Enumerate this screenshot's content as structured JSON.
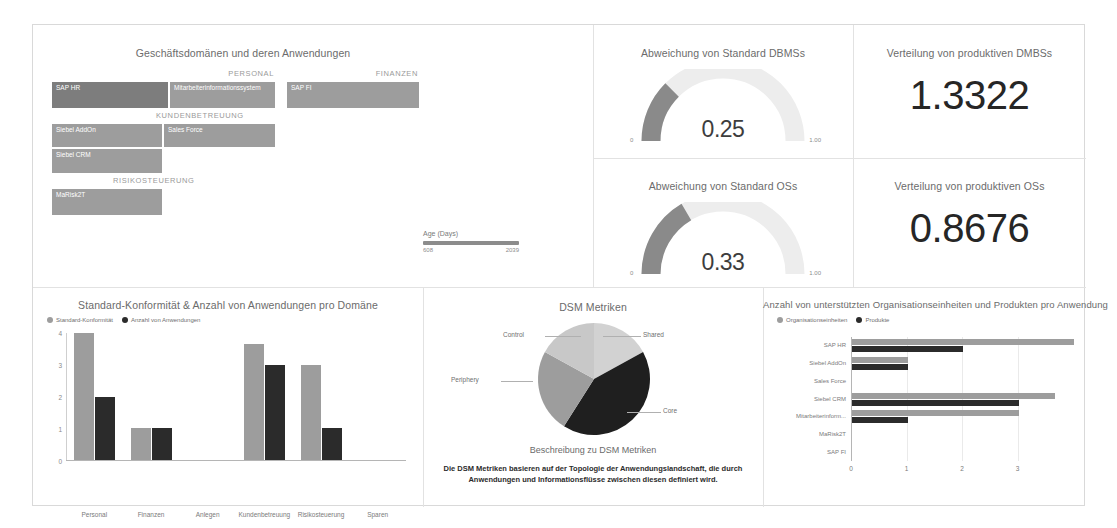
{
  "colors": {
    "series_a": "#9d9d9d",
    "series_b": "#2b2b2b",
    "gauge_fill": "#8a8a8a",
    "gauge_track": "#ededed",
    "panel_border": "#d9d9d9"
  },
  "treemap": {
    "title": "Geschäftsdomänen und deren Anwendungen",
    "groups": [
      {
        "label": "PERSONAL",
        "cells": [
          {
            "label": "SAP HR"
          },
          {
            "label": "Mitarbeiterinformationssystem"
          }
        ]
      },
      {
        "label": "FINANZEN",
        "cells": [
          {
            "label": "SAP FI"
          }
        ]
      },
      {
        "label": "KUNDENBETREUUNG",
        "cells": [
          {
            "label": "Siebel AddOn"
          },
          {
            "label": "Sales Force"
          },
          {
            "label": "Siebel CRM"
          }
        ]
      },
      {
        "label": "RISIKOSTEUERUNG",
        "cells": [
          {
            "label": "MaRisk2T"
          }
        ]
      }
    ]
  },
  "slider": {
    "label": "Age (Days)",
    "min": "608",
    "max": "2039"
  },
  "gauges": [
    {
      "title": "Abweichung von Standard DBMSs",
      "value": "0.25",
      "min": "0",
      "max": "1.00",
      "fraction": 0.25
    },
    {
      "title": "Abweichung von Standard OSs",
      "value": "0.33",
      "min": "0",
      "max": "1.00",
      "fraction": 0.33
    }
  ],
  "kpis": [
    {
      "title": "Verteilung von produktiven DMBSs",
      "value": "1.3322"
    },
    {
      "title": "Verteilung von produktiven OSs",
      "value": "0.8676"
    }
  ],
  "bar_chart": {
    "title": "Standard-Konformität & Anzahl von Anwendungen pro Domäne",
    "legend": [
      {
        "label": "Standard-Konformität",
        "color": "#9d9d9d"
      },
      {
        "label": "Anzahl von Anwendungen",
        "color": "#2b2b2b"
      }
    ],
    "yticks": [
      "0",
      "1",
      "2",
      "3",
      "4"
    ]
  },
  "pie_chart": {
    "title": "DSM Metriken",
    "labels": {
      "shared": "Shared",
      "core": "Core",
      "periphery": "Periphery",
      "control": "Control"
    },
    "description_title": "Beschreibung zu DSM Metriken",
    "description_line1": "Die DSM Metriken basieren auf der Topologie der Anwendungslandschaft, die durch",
    "description_line2": "Anwendungen und Informationsflüsse zwischen diesen definiert wird."
  },
  "hbar_chart": {
    "title": "Anzahl von unterstützten Organisationseinheiten und Produkten pro Anwendung",
    "legend": [
      {
        "label": "Organisationseinheiten",
        "color": "#9d9d9d"
      },
      {
        "label": "Produkte",
        "color": "#2b2b2b"
      }
    ],
    "xticks": [
      "0",
      "1",
      "2",
      "3"
    ]
  },
  "chart_data": [
    {
      "type": "bar",
      "title": "Standard-Konformität & Anzahl von Anwendungen pro Domäne",
      "categories": [
        "Personal",
        "Finanzen",
        "Anlegen",
        "Kundenbetreuung",
        "Risikosteuerung",
        "Sparen"
      ],
      "series": [
        {
          "name": "Standard-Konformität",
          "color": "#9d9d9d",
          "values": [
            4,
            1,
            0,
            3.65,
            3,
            0
          ]
        },
        {
          "name": "Anzahl von Anwendungen",
          "color": "#2b2b2b",
          "values": [
            2,
            1,
            0,
            3,
            1,
            0
          ]
        }
      ],
      "xlabel": "",
      "ylabel": "",
      "ylim": [
        0,
        4
      ],
      "grid": false,
      "legend_position": "top-left"
    },
    {
      "type": "pie",
      "title": "DSM Metriken",
      "categories": [
        "Shared",
        "Core",
        "Periphery",
        "Control"
      ],
      "values": [
        17,
        42,
        24,
        17
      ],
      "colors": [
        "#d2d2d2",
        "#1f1f1f",
        "#9d9d9d",
        "#c8c8c8"
      ],
      "legend_position": "labels-outside"
    },
    {
      "type": "bar",
      "orientation": "horizontal",
      "title": "Anzahl von unterstützten Organisationseinheiten und Produkten pro Anwendung",
      "categories": [
        "SAP HR",
        "Siebel AddOn",
        "Sales Force",
        "Siebel CRM",
        "Mitarbeiterinform...",
        "MaRisk2T",
        "SAP FI"
      ],
      "series": [
        {
          "name": "Organisationseinheiten",
          "color": "#9d9d9d",
          "values": [
            4,
            1,
            0,
            3.65,
            3,
            0,
            0
          ]
        },
        {
          "name": "Produkte",
          "color": "#2b2b2b",
          "values": [
            2,
            1,
            0,
            3,
            1,
            0,
            0
          ]
        }
      ],
      "xlim": [
        0,
        4
      ],
      "xticks": [
        0,
        1,
        2,
        3
      ],
      "grid": false,
      "legend_position": "top-left"
    },
    {
      "type": "gauge",
      "title": "Abweichung von Standard DBMSs",
      "value": 0.25,
      "min": 0,
      "max": 1.0
    },
    {
      "type": "gauge",
      "title": "Abweichung von Standard OSs",
      "value": 0.33,
      "min": 0,
      "max": 1.0
    }
  ]
}
